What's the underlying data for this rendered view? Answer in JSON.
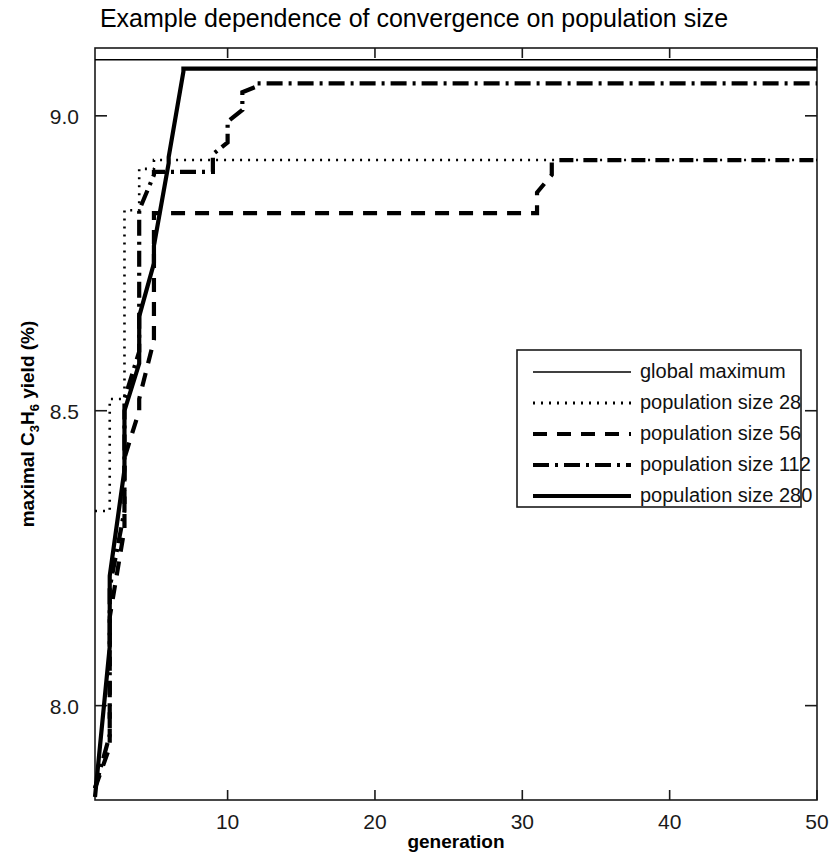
{
  "chart_data": {
    "type": "line",
    "title": "Example dependence of convergence on population size",
    "xlabel": "generation",
    "ylabel_parts": {
      "lead": "maximal C",
      "sub1": "3",
      "mid": "H",
      "sub2": "6",
      "tail": " yield (%)"
    },
    "ylabel": "maximal C3H6 yield (%)",
    "xlim": [
      1,
      50
    ],
    "ylim": [
      7.84,
      9.115
    ],
    "xticks": [
      10,
      20,
      30,
      40,
      50
    ],
    "xtick_labels": [
      "10",
      "20",
      "30",
      "40",
      "50"
    ],
    "yticks": [
      8.0,
      8.5,
      9.0
    ],
    "ytick_labels": [
      "8.0",
      "8.5",
      "9.0"
    ],
    "grid": false,
    "legend_position": "center-right",
    "axis_color": "#1a1a1a",
    "series": [
      {
        "name": "global maximum",
        "style": "solid-thin",
        "stroke_width": 1.4,
        "dasharray": "none",
        "color": "#000000",
        "x": [
          1,
          50
        ],
        "y": [
          9.095,
          9.095
        ]
      },
      {
        "name": "population size 28",
        "style": "dotted",
        "stroke_width": 2.6,
        "dasharray": "2,6",
        "color": "#000000",
        "x": [
          1,
          2,
          2,
          3,
          3,
          4,
          4,
          5,
          5,
          50
        ],
        "y": [
          8.33,
          8.33,
          8.52,
          8.52,
          8.84,
          8.84,
          8.91,
          8.91,
          8.925,
          8.925
        ]
      },
      {
        "name": "population size 56",
        "style": "dashed",
        "stroke_width": 4.2,
        "dasharray": "14,10",
        "color": "#000000",
        "x": [
          1,
          2,
          2,
          3,
          3,
          4,
          4,
          5,
          5,
          31,
          31,
          32,
          32,
          50
        ],
        "y": [
          7.86,
          7.93,
          8.15,
          8.3,
          8.42,
          8.5,
          8.52,
          8.62,
          8.835,
          8.835,
          8.87,
          8.9,
          8.925,
          8.925
        ]
      },
      {
        "name": "population size 112",
        "style": "dash-dot",
        "stroke_width": 4.2,
        "dasharray": "16,6,3,6",
        "color": "#000000",
        "x": [
          1,
          2,
          2,
          3,
          3,
          4,
          4,
          5,
          5,
          9,
          9,
          10,
          10,
          11,
          11,
          12,
          12,
          50
        ],
        "y": [
          7.86,
          7.95,
          8.2,
          8.33,
          8.52,
          8.6,
          8.84,
          8.9,
          8.905,
          8.905,
          8.935,
          8.955,
          8.99,
          9.01,
          9.04,
          9.05,
          9.055,
          9.055
        ]
      },
      {
        "name": "population size 280",
        "style": "solid-thick",
        "stroke_width": 4.2,
        "dasharray": "none",
        "color": "#000000",
        "x": [
          1,
          2,
          2,
          3,
          3,
          4,
          4,
          5,
          5,
          6,
          6,
          7,
          7,
          50
        ],
        "y": [
          7.845,
          8.1,
          8.22,
          8.4,
          8.5,
          8.58,
          8.66,
          8.75,
          8.78,
          8.92,
          8.93,
          9.075,
          9.08,
          9.08
        ]
      }
    ],
    "legend_entries": [
      {
        "label": "global maximum",
        "style": "solid-thin"
      },
      {
        "label": "population size 28",
        "style": "dotted"
      },
      {
        "label": "population size 56",
        "style": "dashed"
      },
      {
        "label": "population size 112",
        "style": "dash-dot"
      },
      {
        "label": "population size 280",
        "style": "solid-thick"
      }
    ]
  }
}
